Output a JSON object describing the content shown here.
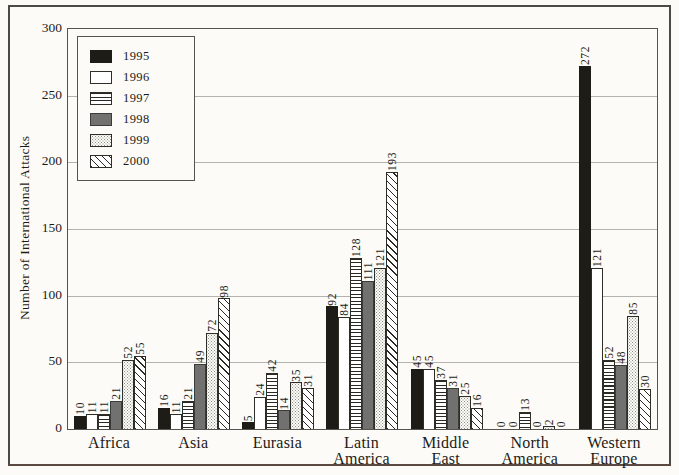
{
  "figure": {
    "y_axis_title": "Number of International Attacks"
  },
  "chart_data": {
    "type": "bar",
    "title": "",
    "xlabel": "",
    "ylabel": "Number of International Attacks",
    "ylim": [
      0,
      300
    ],
    "y_ticks": [
      300,
      250,
      200,
      150,
      100,
      50,
      0
    ],
    "grid": true,
    "legend_position": "upper-left",
    "categories": [
      "Africa",
      "Asia",
      "Eurasia",
      "Latin America",
      "Middle East",
      "North America",
      "Western Europe"
    ],
    "series": [
      {
        "name": "1995",
        "pattern": "solid-black",
        "values": [
          10,
          16,
          5,
          92,
          45,
          0,
          272
        ]
      },
      {
        "name": "1996",
        "pattern": "white",
        "values": [
          11,
          11,
          24,
          84,
          45,
          0,
          121
        ]
      },
      {
        "name": "1997",
        "pattern": "hlines",
        "values": [
          11,
          21,
          42,
          128,
          37,
          13,
          52
        ]
      },
      {
        "name": "1998",
        "pattern": "solid-gray",
        "values": [
          21,
          49,
          14,
          111,
          31,
          0,
          48
        ]
      },
      {
        "name": "1999",
        "pattern": "stipple",
        "values": [
          52,
          72,
          35,
          121,
          25,
          2,
          85
        ]
      },
      {
        "name": "2000",
        "pattern": "diagonal",
        "values": [
          55,
          98,
          31,
          193,
          16,
          0,
          30
        ]
      }
    ]
  },
  "colors": {
    "page_background": "#fcfbf7",
    "bar_black": "#1d1c16",
    "bar_gray": "#717170",
    "pattern_line": "#2a2922",
    "stipple_dot": "#8f8e86",
    "grid_line": "#b3b2ad",
    "plot_border": "#55544e",
    "outer_border": "#4a4a46",
    "text": "#1c1b18"
  }
}
